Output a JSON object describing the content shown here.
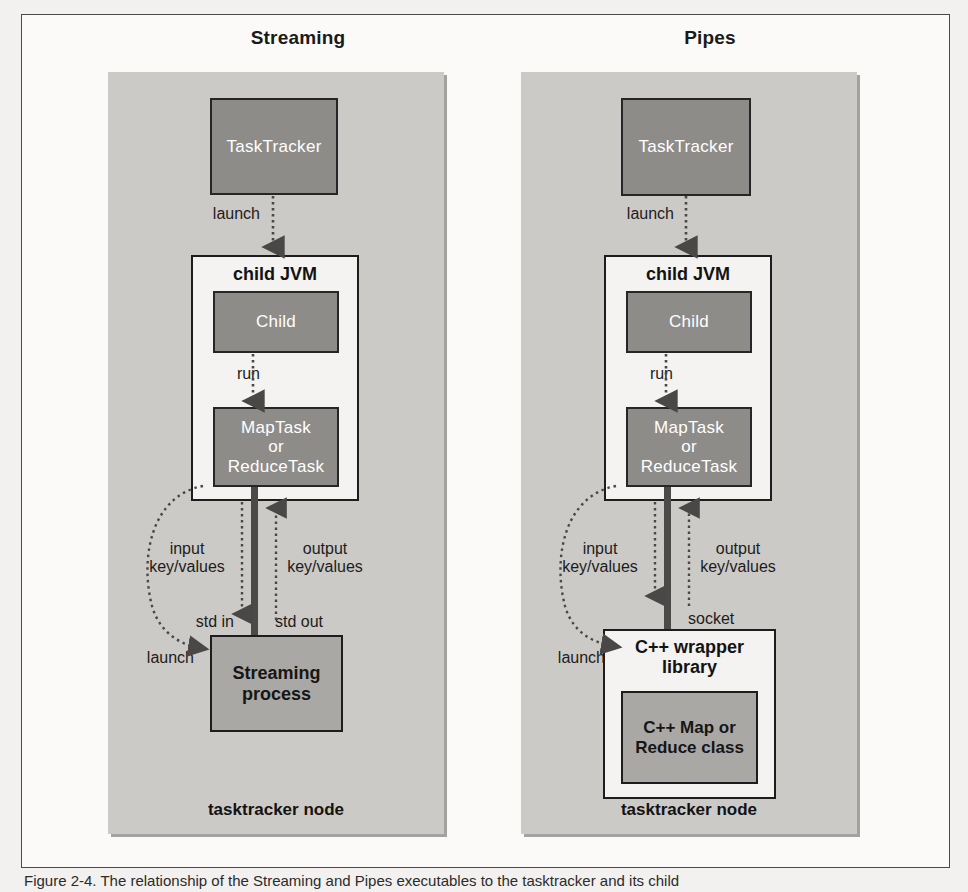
{
  "figure": {
    "caption": "Figure 2-4. The relationship of the Streaming and Pipes executables to the tasktracker and its child"
  },
  "panels": [
    {
      "title": "Streaming",
      "node_caption": "tasktracker node",
      "tasktracker": "TaskTracker",
      "launch_top_label": "launch",
      "jvm_label": "child JVM",
      "child": "Child",
      "run_label": "run",
      "task": "MapTask\nor\nReduceTask",
      "task_line1": "MapTask",
      "task_line2": "or",
      "task_line3": "ReduceTask",
      "input_label": "input\nkey/values",
      "input_line1": "input",
      "input_line2": "key/values",
      "output_label": "output\nkey/values",
      "output_line1": "output",
      "output_line2": "key/values",
      "in_port": "std in",
      "out_port": "std out",
      "launch_curve_label": "launch",
      "process_line1": "Streaming",
      "process_line2": "process",
      "inner_line1": "",
      "inner_line2": ""
    },
    {
      "title": "Pipes",
      "node_caption": "tasktracker node",
      "tasktracker": "TaskTracker",
      "launch_top_label": "launch",
      "jvm_label": "child JVM",
      "child": "Child",
      "run_label": "run",
      "task_line1": "MapTask",
      "task_line2": "or",
      "task_line3": "ReduceTask",
      "input_line1": "input",
      "input_line2": "key/values",
      "output_line1": "output",
      "output_line2": "key/values",
      "in_port": "",
      "out_port": "socket",
      "launch_curve_label": "launch",
      "process_line1": "C++ wrapper",
      "process_line2": "library",
      "inner_line1": "C++ Map or",
      "inner_line2": "Reduce class"
    }
  ],
  "colors": {
    "panel_bg": "#cccac7",
    "dark_box": "#8e8c89",
    "mid_box": "#aaa8a5",
    "white_box": "#f4f3f1",
    "border": "#1d1d1d",
    "text": "#131313"
  }
}
